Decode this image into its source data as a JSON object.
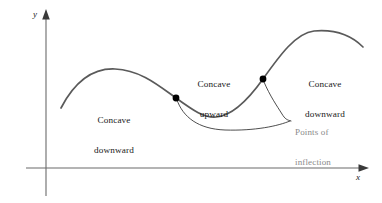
{
  "figure": {
    "background_color": "#ffffff",
    "curve_color": "#5a5a5a",
    "axis_color": "#6b6b6b",
    "text_color": "#1a1a1a",
    "callout_text_color": "#8a8a8a",
    "point_color": "#000000"
  },
  "axes": {
    "y_label": "y",
    "x_label": "x",
    "origin": {
      "x": 46,
      "y": 168
    },
    "y_axis": {
      "x": 46,
      "y_top": 12,
      "y_bottom": 196
    },
    "x_axis": {
      "y": 168,
      "x_left": 26,
      "x_right": 368
    }
  },
  "labels": {
    "concave_downward_left": {
      "line1": "Concave",
      "line2": "downward",
      "x": 114,
      "y": 95
    },
    "concave_upward": {
      "line1": "Concave",
      "line2": "upward",
      "x": 214,
      "y": 59
    },
    "concave_downward_right": {
      "line1": "Concave",
      "line2": "downward",
      "x": 325,
      "y": 59
    },
    "points_of_inflection": {
      "line1": "Points of",
      "line2": "inflection",
      "x": 295,
      "y": 108
    }
  },
  "inflection_points": [
    {
      "name": "first-inflection-point",
      "x": 176,
      "y": 98,
      "radius": 3.4
    },
    {
      "name": "second-inflection-point",
      "x": 263,
      "y": 79,
      "radius": 3.4
    }
  ],
  "chart_data": {
    "type": "line",
    "xlabel": "x",
    "ylabel": "y",
    "grid": false,
    "legend": null,
    "annotations": [
      {
        "text": "Concave downward",
        "region": "left-hump",
        "at_x": 114,
        "at_y": 95
      },
      {
        "text": "Concave upward",
        "region": "middle-valley",
        "at_x": 214,
        "at_y": 59
      },
      {
        "text": "Concave downward",
        "region": "right-hump",
        "at_x": 325,
        "at_y": 59
      },
      {
        "text": "Points of inflection",
        "region": "callout",
        "at_x": 295,
        "at_y": 108
      }
    ],
    "series": [
      {
        "name": "cubic-like curve",
        "path": "M 61,108 C 74,83 92,68 115,69 C 140,70 158,85 176,98 C 194,111 204,118 216,117 C 232,116 248,100 263,79 C 280,55 296,33 314,31 C 336,29 352,36 363,47",
        "points": [
          {
            "x": 61,
            "y": 108
          },
          {
            "x": 115,
            "y": 69
          },
          {
            "x": 176,
            "y": 98
          },
          {
            "x": 216,
            "y": 117
          },
          {
            "x": 263,
            "y": 79
          },
          {
            "x": 314,
            "y": 31
          },
          {
            "x": 363,
            "y": 47
          }
        ],
        "markers": [
          {
            "x": 176,
            "y": 98,
            "label": "point of inflection"
          },
          {
            "x": 263,
            "y": 79,
            "label": "point of inflection"
          }
        ]
      }
    ],
    "leader_lines": [
      {
        "name": "leader-from-first-point",
        "path": "M 177,100 C 183,117 198,129 225,130 C 255,131 278,126 290,121"
      },
      {
        "name": "leader-from-second-point",
        "path": "M 264,82 C 270,96 277,106 282,114 C 285,119 287,120 291,121"
      }
    ]
  }
}
